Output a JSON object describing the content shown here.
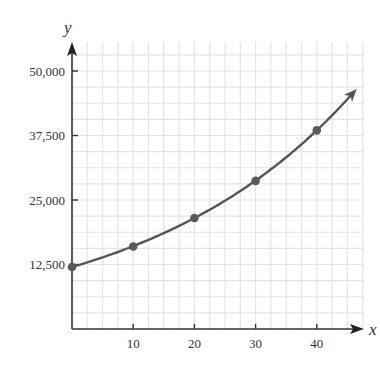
{
  "chart_data": {
    "type": "line",
    "title": "",
    "xlabel": "x",
    "ylabel": "y",
    "x": [
      0,
      10,
      20,
      30,
      40
    ],
    "series": [
      {
        "name": "y",
        "values": [
          12000,
          16000,
          21500,
          28700,
          38500
        ],
        "markers": true,
        "curve": "exponential",
        "arrow_end": true
      }
    ],
    "xticks": [
      10,
      20,
      30,
      40
    ],
    "xtick_labels": [
      "10",
      "20",
      "30",
      "40"
    ],
    "yticks": [
      12500,
      25000,
      37500,
      50000
    ],
    "ytick_labels": [
      "12,500",
      "25,000",
      "37,500",
      "50,000"
    ],
    "xlim": [
      0,
      47
    ],
    "ylim": [
      0,
      55000
    ],
    "grid": true,
    "legend": null,
    "colors": {
      "curve": "#555555",
      "marker": "#5a5a5a",
      "grid": "#e4e4e4",
      "axis": "#333333"
    }
  },
  "axes": {
    "x_label": "x",
    "y_label": "y",
    "x_ticks": [
      "10",
      "20",
      "30",
      "40"
    ],
    "y_ticks": [
      "12,500",
      "25,000",
      "37,500",
      "50,000"
    ]
  }
}
